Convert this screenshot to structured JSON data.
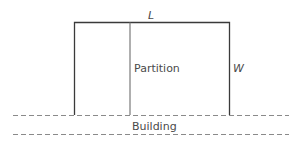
{
  "diagram": {
    "labels": {
      "length": "L",
      "width": "W",
      "partition": "Partition",
      "building": "Building"
    },
    "colors": {
      "outline": "#3a3a3a",
      "partition": "#7a7a7a",
      "dashed": "#8a8a8a",
      "text": "#4a4a4a"
    }
  }
}
